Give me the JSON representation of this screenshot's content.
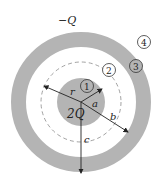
{
  "diagram": {
    "labels": {
      "outer_charge": "−Q",
      "inner_charge": "2Q",
      "r": "r",
      "a": "a",
      "b": "b",
      "c": "c"
    },
    "regions": [
      "1",
      "2",
      "3",
      "4"
    ],
    "colors": {
      "conductor": "#b4b4b4",
      "stroke": "#555555",
      "dashed": "#8a8a8a",
      "arrow": "#222222"
    }
  }
}
